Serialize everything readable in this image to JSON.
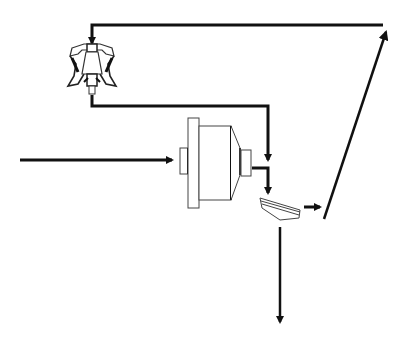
{
  "diagram": {
    "type": "process-flow",
    "colors": {
      "background": "#ffffff",
      "line": "#111111",
      "equipment_outline": "#555555",
      "equipment_fill": "#ffffff"
    },
    "nodes": [
      {
        "id": "crusher",
        "icon": "cone-crusher-icon"
      },
      {
        "id": "ball-mill",
        "icon": "ball-mill-icon"
      },
      {
        "id": "classifier",
        "icon": "classifier-icon"
      }
    ],
    "edges": [
      {
        "id": "feed",
        "from": "external",
        "to": "ball-mill"
      },
      {
        "id": "mill-discharge",
        "from": "ball-mill",
        "to": "classifier"
      },
      {
        "id": "classifier-oversize",
        "from": "classifier",
        "to": "recycle-line"
      },
      {
        "id": "recycle-up",
        "from": "classifier",
        "to": "crusher"
      },
      {
        "id": "crusher-product",
        "from": "crusher",
        "to": "classifier"
      },
      {
        "id": "final-product",
        "from": "classifier",
        "to": "external"
      }
    ],
    "labels": []
  }
}
